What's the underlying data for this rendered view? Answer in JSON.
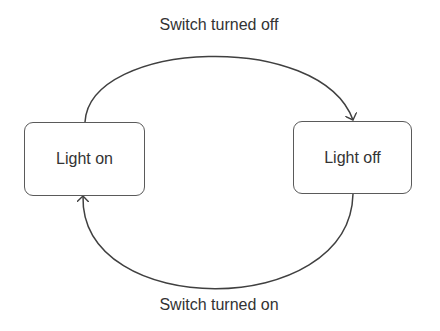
{
  "diagram": {
    "type": "state-transition",
    "states": [
      {
        "id": "light-on",
        "label": "Light on"
      },
      {
        "id": "light-off",
        "label": "Light off"
      }
    ],
    "transitions": [
      {
        "from": "light-on",
        "to": "light-off",
        "label": "Switch turned off"
      },
      {
        "from": "light-off",
        "to": "light-on",
        "label": "Switch turned on"
      }
    ],
    "colors": {
      "stroke": "#404040",
      "box_border": "#5a5a5a",
      "text": "#333333",
      "background": "#ffffff"
    }
  }
}
